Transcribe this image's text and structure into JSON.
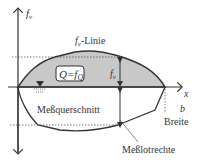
{
  "diagram": {
    "labels": {
      "y_axis": "f",
      "y_axis_sub": "v",
      "x_axis": "x",
      "fv_line": "f",
      "fv_line_sub": "v",
      "fv_line_suffix": "-Linie",
      "q_box": "Q=f",
      "q_box_sub": "Q",
      "fv_height": "f",
      "fv_height_sub": "v",
      "cross_section": "Meßquerschnitt",
      "width_symbol": "b",
      "width_label": "Breite",
      "vertical": "Meßlotrechte"
    },
    "colors": {
      "line": "#333333",
      "fill": "#c8c8c8",
      "background": "#ffffff"
    }
  }
}
